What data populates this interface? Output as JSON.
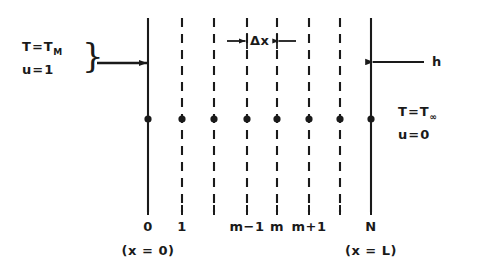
{
  "figure": {
    "type": "finite-difference-grid-diagram",
    "width": 491,
    "height": 270,
    "background": "#ffffff",
    "ink_color": "#1a1a1a"
  },
  "left_boundary": {
    "line1_prefix": "T",
    "line1_equals": "=",
    "line1_symbol": "T",
    "line1_subscript": "M",
    "line2_prefix": "u",
    "line2_equals": "=",
    "line2_value": "1",
    "brace": "}",
    "arrow": "arrow-right"
  },
  "right_boundary": {
    "line1_prefix": "T",
    "line1_equals": "=",
    "line1_symbol": "T",
    "line1_subscript": "∞",
    "line2_prefix": "u",
    "line2_equals": "=",
    "line2_value": "0",
    "convection_label": "h",
    "arrow": "arrow-left"
  },
  "spacing": {
    "label": "Δx",
    "left_arrow": "arrow-right",
    "right_arrow": "arrow-left"
  },
  "grid": {
    "node_count": 8,
    "line_x": [
      148,
      182,
      214,
      247,
      277,
      309,
      340,
      371
    ],
    "line_styles": [
      "solid",
      "dashed",
      "dashed",
      "dashed",
      "dashed",
      "dashed",
      "dashed",
      "solid"
    ],
    "line_top": 18,
    "line_bottom": 212,
    "node_dot_y": 119,
    "node_dot_radius": 3.6,
    "index_labels": [
      "0",
      "1",
      "",
      "m−1",
      "m",
      "m+1",
      "",
      "N"
    ],
    "position_labels": [
      {
        "index": 0,
        "text": "(x = 0)"
      },
      {
        "index": 7,
        "text": "(x = L)"
      }
    ]
  }
}
